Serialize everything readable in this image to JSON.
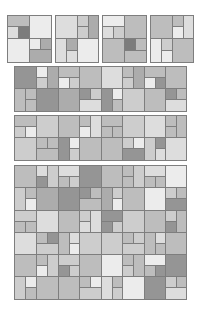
{
  "palette": {
    "L1": "#ececec",
    "L2": "#dddddd",
    "L3": "#cdcdcd",
    "L4": "#bdbdbd",
    "L5": "#acacac",
    "L6": "#959595",
    "L7": "#7c7c7c",
    "border": "#7e7e7e"
  },
  "panels": [
    {
      "name": "tile-1",
      "x": 7,
      "y": 15,
      "w": 44,
      "h": 47,
      "cells": [
        [
          0,
          0,
          22,
          11,
          "L4"
        ],
        [
          22,
          0,
          22,
          23,
          "L1"
        ],
        [
          0,
          11,
          11,
          12,
          "L2"
        ],
        [
          11,
          11,
          11,
          12,
          "L7"
        ],
        [
          0,
          23,
          22,
          24,
          "L1"
        ],
        [
          22,
          23,
          11,
          11,
          "L1"
        ],
        [
          33,
          23,
          11,
          11,
          "L5"
        ],
        [
          22,
          34,
          22,
          13,
          "L5"
        ]
      ]
    },
    {
      "name": "tile-2",
      "x": 55,
      "y": 15,
      "w": 43,
      "h": 47,
      "cells": [
        [
          0,
          0,
          22,
          23,
          "L2"
        ],
        [
          22,
          0,
          11,
          11,
          "L3"
        ],
        [
          33,
          0,
          10,
          23,
          "L5"
        ],
        [
          22,
          11,
          11,
          12,
          "L3"
        ],
        [
          0,
          23,
          11,
          24,
          "L2"
        ],
        [
          11,
          23,
          11,
          12,
          "L5"
        ],
        [
          22,
          23,
          21,
          24,
          "L1"
        ],
        [
          11,
          35,
          11,
          12,
          "L2"
        ]
      ]
    },
    {
      "name": "tile-3",
      "x": 102,
      "y": 15,
      "w": 44,
      "h": 47,
      "cells": [
        [
          0,
          0,
          22,
          11,
          "L1"
        ],
        [
          22,
          0,
          22,
          23,
          "L4"
        ],
        [
          0,
          11,
          11,
          12,
          "L2"
        ],
        [
          11,
          11,
          11,
          12,
          "L3"
        ],
        [
          0,
          23,
          22,
          24,
          "L4"
        ],
        [
          22,
          23,
          11,
          12,
          "L7"
        ],
        [
          33,
          23,
          11,
          12,
          "L4"
        ],
        [
          22,
          35,
          22,
          12,
          "L4"
        ]
      ]
    },
    {
      "name": "tile-4",
      "x": 150,
      "y": 15,
      "w": 43,
      "h": 47,
      "cells": [
        [
          0,
          0,
          22,
          23,
          "L4"
        ],
        [
          22,
          0,
          11,
          11,
          "L4"
        ],
        [
          33,
          0,
          10,
          23,
          "L2"
        ],
        [
          22,
          11,
          11,
          12,
          "L1"
        ],
        [
          0,
          23,
          11,
          24,
          "L1"
        ],
        [
          11,
          23,
          11,
          12,
          "L3"
        ],
        [
          22,
          23,
          21,
          24,
          "L4"
        ],
        [
          11,
          35,
          11,
          12,
          "L1"
        ]
      ]
    },
    {
      "name": "mosaic-row-1",
      "x": 14,
      "y": 66,
      "w": 172,
      "h": 45,
      "cells": [
        [
          0,
          0,
          22,
          22,
          "L6"
        ],
        [
          22,
          0,
          11,
          11,
          "L1"
        ],
        [
          33,
          0,
          11,
          22,
          "L5"
        ],
        [
          44,
          0,
          21,
          11,
          "L4"
        ],
        [
          65,
          0,
          22,
          22,
          "L4"
        ],
        [
          87,
          0,
          21,
          22,
          "L2"
        ],
        [
          108,
          0,
          11,
          11,
          "L4"
        ],
        [
          119,
          0,
          11,
          22,
          "L5"
        ],
        [
          130,
          0,
          21,
          11,
          "L4"
        ],
        [
          151,
          0,
          21,
          22,
          "L4"
        ],
        [
          22,
          11,
          11,
          11,
          "L3"
        ],
        [
          44,
          11,
          11,
          11,
          "L1"
        ],
        [
          55,
          11,
          10,
          11,
          "L3"
        ],
        [
          108,
          11,
          11,
          11,
          "L3"
        ],
        [
          130,
          11,
          11,
          11,
          "L1"
        ],
        [
          141,
          11,
          10,
          11,
          "L6"
        ],
        [
          0,
          22,
          11,
          23,
          "L4"
        ],
        [
          11,
          22,
          11,
          11,
          "L4"
        ],
        [
          22,
          22,
          22,
          23,
          "L6"
        ],
        [
          44,
          22,
          21,
          23,
          "L5"
        ],
        [
          65,
          22,
          11,
          11,
          "L6"
        ],
        [
          76,
          22,
          11,
          11,
          "L3"
        ],
        [
          87,
          22,
          11,
          23,
          "L6"
        ],
        [
          98,
          22,
          10,
          11,
          "L1"
        ],
        [
          108,
          22,
          22,
          23,
          "L3"
        ],
        [
          130,
          22,
          21,
          23,
          "L4"
        ],
        [
          151,
          22,
          11,
          11,
          "L6"
        ],
        [
          162,
          22,
          10,
          11,
          "L4"
        ],
        [
          11,
          33,
          11,
          12,
          "L4"
        ],
        [
          65,
          33,
          22,
          12,
          "L2"
        ],
        [
          98,
          33,
          10,
          12,
          "L4"
        ],
        [
          151,
          33,
          21,
          12,
          "L2"
        ]
      ]
    },
    {
      "name": "mosaic-row-2",
      "x": 14,
      "y": 115,
      "w": 172,
      "h": 45,
      "cells": [
        [
          0,
          0,
          22,
          11,
          "L4"
        ],
        [
          22,
          0,
          22,
          22,
          "L3"
        ],
        [
          44,
          0,
          21,
          22,
          "L4"
        ],
        [
          65,
          0,
          11,
          11,
          "L4"
        ],
        [
          76,
          0,
          11,
          22,
          "L2"
        ],
        [
          87,
          0,
          21,
          11,
          "L4"
        ],
        [
          108,
          0,
          22,
          22,
          "L3"
        ],
        [
          130,
          0,
          21,
          22,
          "L2"
        ],
        [
          151,
          0,
          11,
          11,
          "L4"
        ],
        [
          162,
          0,
          10,
          22,
          "L4"
        ],
        [
          0,
          11,
          11,
          11,
          "L3"
        ],
        [
          11,
          11,
          11,
          11,
          "L1"
        ],
        [
          65,
          11,
          11,
          11,
          "L1"
        ],
        [
          87,
          11,
          11,
          11,
          "L4"
        ],
        [
          98,
          11,
          10,
          11,
          "L4"
        ],
        [
          151,
          11,
          11,
          11,
          "L4"
        ],
        [
          0,
          22,
          22,
          23,
          "L3"
        ],
        [
          22,
          22,
          11,
          11,
          "L4"
        ],
        [
          33,
          22,
          11,
          11,
          "L4"
        ],
        [
          44,
          22,
          11,
          23,
          "L6"
        ],
        [
          55,
          22,
          10,
          11,
          "L1"
        ],
        [
          65,
          22,
          22,
          23,
          "L4"
        ],
        [
          87,
          22,
          21,
          23,
          "L4"
        ],
        [
          108,
          22,
          11,
          11,
          "L3"
        ],
        [
          119,
          22,
          11,
          11,
          "L1"
        ],
        [
          130,
          22,
          11,
          23,
          "L3"
        ],
        [
          141,
          22,
          10,
          11,
          "L6"
        ],
        [
          151,
          22,
          21,
          23,
          "L2"
        ],
        [
          22,
          33,
          22,
          12,
          "L4"
        ],
        [
          55,
          33,
          10,
          12,
          "L3"
        ],
        [
          108,
          33,
          22,
          12,
          "L6"
        ],
        [
          141,
          33,
          10,
          12,
          "L2"
        ]
      ]
    },
    {
      "name": "mosaic-grid",
      "x": 14,
      "y": 165,
      "w": 172,
      "h": 134,
      "cells": [
        [
          0,
          0,
          22,
          22,
          "L4"
        ],
        [
          22,
          0,
          11,
          11,
          "L2"
        ],
        [
          33,
          0,
          11,
          22,
          "L3"
        ],
        [
          44,
          0,
          21,
          11,
          "L2"
        ],
        [
          65,
          0,
          22,
          22,
          "L6"
        ],
        [
          87,
          0,
          21,
          22,
          "L4"
        ],
        [
          108,
          0,
          11,
          11,
          "L4"
        ],
        [
          119,
          0,
          11,
          22,
          "L3"
        ],
        [
          130,
          0,
          21,
          11,
          "L2"
        ],
        [
          151,
          0,
          21,
          22,
          "L1"
        ],
        [
          22,
          11,
          11,
          11,
          "L6"
        ],
        [
          44,
          11,
          11,
          11,
          "L4"
        ],
        [
          55,
          11,
          10,
          11,
          "L3"
        ],
        [
          108,
          11,
          11,
          11,
          "L4"
        ],
        [
          130,
          11,
          11,
          11,
          "L4"
        ],
        [
          141,
          11,
          10,
          11,
          "L4"
        ],
        [
          0,
          22,
          11,
          23,
          "L3"
        ],
        [
          11,
          22,
          11,
          11,
          "L4"
        ],
        [
          22,
          22,
          22,
          23,
          "L5"
        ],
        [
          44,
          22,
          21,
          23,
          "L6"
        ],
        [
          65,
          22,
          11,
          11,
          "L6"
        ],
        [
          76,
          22,
          11,
          11,
          "L4"
        ],
        [
          87,
          22,
          11,
          23,
          "L5"
        ],
        [
          98,
          22,
          10,
          11,
          "L3"
        ],
        [
          108,
          22,
          22,
          23,
          "L4"
        ],
        [
          130,
          22,
          21,
          23,
          "L1"
        ],
        [
          151,
          22,
          11,
          11,
          "L3"
        ],
        [
          162,
          22,
          10,
          11,
          "L4"
        ],
        [
          11,
          33,
          11,
          12,
          "L1"
        ],
        [
          65,
          33,
          22,
          12,
          "L4"
        ],
        [
          98,
          33,
          10,
          12,
          "L1"
        ],
        [
          151,
          33,
          21,
          12,
          "L6"
        ],
        [
          0,
          45,
          22,
          11,
          "L3"
        ],
        [
          22,
          45,
          22,
          22,
          "L2"
        ],
        [
          44,
          45,
          21,
          22,
          "L4"
        ],
        [
          65,
          45,
          11,
          11,
          "L3"
        ],
        [
          76,
          45,
          11,
          22,
          "L2"
        ],
        [
          87,
          45,
          21,
          11,
          "L6"
        ],
        [
          108,
          45,
          22,
          22,
          "L3"
        ],
        [
          130,
          45,
          21,
          22,
          "L4"
        ],
        [
          151,
          45,
          11,
          11,
          "L3"
        ],
        [
          162,
          45,
          10,
          22,
          "L4"
        ],
        [
          0,
          56,
          11,
          11,
          "L4"
        ],
        [
          11,
          56,
          11,
          11,
          "L4"
        ],
        [
          65,
          56,
          11,
          11,
          "L2"
        ],
        [
          87,
          56,
          11,
          11,
          "L6"
        ],
        [
          98,
          56,
          10,
          11,
          "L3"
        ],
        [
          151,
          56,
          11,
          11,
          "L6"
        ],
        [
          0,
          67,
          22,
          22,
          "L2"
        ],
        [
          22,
          67,
          11,
          11,
          "L4"
        ],
        [
          33,
          67,
          11,
          11,
          "L6"
        ],
        [
          44,
          67,
          11,
          22,
          "L4"
        ],
        [
          55,
          67,
          10,
          11,
          "L2"
        ],
        [
          65,
          67,
          22,
          22,
          "L3"
        ],
        [
          87,
          67,
          21,
          22,
          "L3"
        ],
        [
          108,
          67,
          11,
          11,
          "L4"
        ],
        [
          119,
          67,
          11,
          11,
          "L3"
        ],
        [
          130,
          67,
          11,
          22,
          "L4"
        ],
        [
          141,
          67,
          10,
          11,
          "L2"
        ],
        [
          151,
          67,
          21,
          22,
          "L4"
        ],
        [
          22,
          78,
          22,
          11,
          "L3"
        ],
        [
          55,
          78,
          10,
          11,
          "L1"
        ],
        [
          108,
          78,
          22,
          11,
          "L3"
        ],
        [
          141,
          78,
          10,
          11,
          "L4"
        ],
        [
          0,
          89,
          22,
          22,
          "L4"
        ],
        [
          22,
          89,
          11,
          11,
          "L4"
        ],
        [
          33,
          89,
          11,
          22,
          "L3"
        ],
        [
          44,
          89,
          21,
          11,
          "L3"
        ],
        [
          65,
          89,
          22,
          22,
          "L4"
        ],
        [
          87,
          89,
          21,
          22,
          "L1"
        ],
        [
          108,
          89,
          11,
          11,
          "L4"
        ],
        [
          119,
          89,
          11,
          22,
          "L4"
        ],
        [
          130,
          89,
          21,
          11,
          "L1"
        ],
        [
          151,
          89,
          21,
          22,
          "L6"
        ],
        [
          22,
          100,
          11,
          11,
          "L1"
        ],
        [
          44,
          100,
          11,
          11,
          "L6"
        ],
        [
          55,
          100,
          10,
          11,
          "L3"
        ],
        [
          108,
          100,
          11,
          11,
          "L3"
        ],
        [
          130,
          100,
          11,
          11,
          "L4"
        ],
        [
          141,
          100,
          10,
          11,
          "L6"
        ],
        [
          0,
          111,
          11,
          23,
          "L3"
        ],
        [
          11,
          111,
          11,
          11,
          "L1"
        ],
        [
          22,
          111,
          22,
          23,
          "L4"
        ],
        [
          44,
          111,
          21,
          23,
          "L4"
        ],
        [
          65,
          111,
          11,
          11,
          "L4"
        ],
        [
          76,
          111,
          11,
          11,
          "L1"
        ],
        [
          87,
          111,
          11,
          23,
          "L2"
        ],
        [
          98,
          111,
          10,
          11,
          "L4"
        ],
        [
          108,
          111,
          22,
          23,
          "L1"
        ],
        [
          130,
          111,
          21,
          23,
          "L6"
        ],
        [
          151,
          111,
          11,
          11,
          "L3"
        ],
        [
          162,
          111,
          10,
          11,
          "L4"
        ],
        [
          11,
          122,
          11,
          12,
          "L4"
        ],
        [
          65,
          122,
          22,
          12,
          "L3"
        ],
        [
          98,
          122,
          10,
          12,
          "L3"
        ],
        [
          151,
          122,
          21,
          12,
          "L2"
        ]
      ]
    }
  ]
}
